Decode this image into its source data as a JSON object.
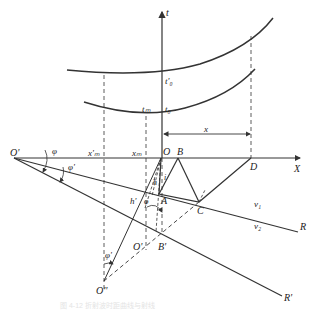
{
  "diagram": {
    "type": "seismic refraction ray geometry",
    "colors": {
      "line": "#333333",
      "background": "#ffffff",
      "caption": "#e4e4e4"
    },
    "axes": {
      "time_axis_label": "t",
      "distance_axis_label": "X"
    },
    "curve_labels": {
      "t0_prime": "t'₀",
      "tm": "tₘ",
      "t0": "t₀"
    },
    "points": {
      "O_prime": "O'",
      "O": "O",
      "B": "B",
      "D": "D",
      "A": "A",
      "C": "C",
      "B_prime": "B'",
      "O_mid": "O'",
      "O_double_prime": "O''",
      "R": "R",
      "R_prime": "R'"
    },
    "markers": {
      "xm_prime": "x'ₘ",
      "xm": "xₘ",
      "x": "x"
    },
    "angles": {
      "phi": "φ",
      "phi_prime": "φ'",
      "phi_at_A": "φ",
      "phi_prime_at_bottom": "φ'"
    },
    "lengths": {
      "h": "h",
      "h_prime": "h'",
      "i": "i"
    },
    "velocities": {
      "v1": "v₁",
      "v2": "v₂"
    },
    "caption": "图 4-12  折射波时距曲线与射线"
  }
}
